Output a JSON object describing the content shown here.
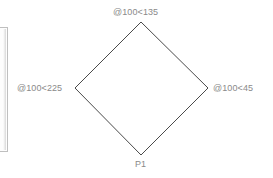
{
  "canvas": {
    "background_color": "#ffffff",
    "width": 273,
    "height": 178
  },
  "left_panel": {
    "name": "panel-edge",
    "border_color": "#bfbfbf"
  },
  "diagram": {
    "shape": "diamond",
    "stroke_color": "#4a4a4a",
    "stroke_width": 1,
    "fill": "none",
    "vertices": [
      {
        "id": "top",
        "x": 141,
        "y": 22,
        "label": "@100<135"
      },
      {
        "id": "right",
        "x": 208,
        "y": 88,
        "label": "@100<45"
      },
      {
        "id": "bottom",
        "x": 141,
        "y": 155,
        "label": "P1"
      },
      {
        "id": "left",
        "x": 75,
        "y": 88,
        "label": "@100<225"
      }
    ]
  },
  "labels": {
    "top": "@100<135",
    "left": "@100<225",
    "right": "@100<45",
    "bottom": "P1",
    "text_color": "#8a8a8a"
  }
}
